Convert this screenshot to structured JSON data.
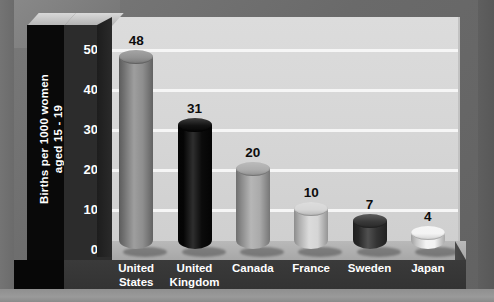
{
  "chart_data": {
    "type": "bar",
    "title": "",
    "subtitle": "",
    "xlabel": "",
    "ylabel": "Births per 1000 women\naged 15 - 19",
    "categories": [
      "United\nStates",
      "United\nKingdom",
      "Canada",
      "France",
      "Sweden",
      "Japan"
    ],
    "values": [
      48,
      31,
      20,
      10,
      7,
      4
    ],
    "value_labels": [
      "48",
      "31",
      "20",
      "10",
      "7",
      "4"
    ],
    "ytick_labels": [
      "0",
      "10",
      "20",
      "30",
      "40",
      "50"
    ],
    "ytick_values": [
      0,
      10,
      20,
      30,
      40,
      50
    ],
    "ylim": [
      0,
      58
    ],
    "grid": true,
    "grid_axis": "y",
    "legend": false,
    "legend_position": "none",
    "style": "3d-cylinder",
    "bar_colors": [
      "#8c8c8c",
      "#060606",
      "#a8a8a8",
      "#d4d4d4",
      "#2f2f2f",
      "#f2f2f2"
    ]
  },
  "colors": {
    "outer_background": "#6a6a6a",
    "plot_wall": "#d6d6d6",
    "gridline": "#f6f6f6",
    "axis_panel_dark": "#2c2c2c",
    "axis_title_panel": "#090909",
    "base_slab": "#343434",
    "floor_top": "#b0b0b0",
    "tick_text": "#ffffff",
    "category_text": "#ffffff",
    "value_text": "#0d0d0d"
  }
}
